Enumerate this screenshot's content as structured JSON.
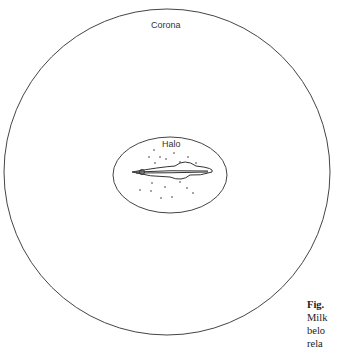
{
  "labels": {
    "corona": "Corona",
    "halo": "Halo"
  },
  "caption": {
    "line1_bold": "Fig.",
    "line2": "Milk",
    "line3": "belo",
    "line4": "rela"
  },
  "colors": {
    "stroke": "#333333",
    "background": "#ffffff"
  }
}
